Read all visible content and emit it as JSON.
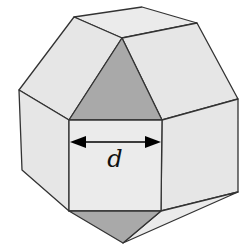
{
  "figure": {
    "dimension_label": "d",
    "colors": {
      "light_face": "#e6e6e6",
      "dark_face": "#a9a9a9",
      "edge": "#333333",
      "arrow": "#000000"
    }
  }
}
